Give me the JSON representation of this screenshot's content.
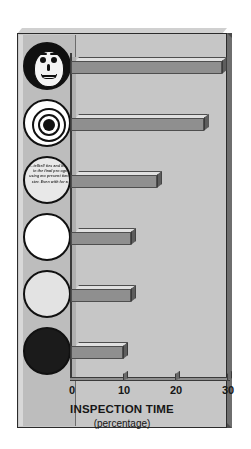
{
  "figure": {
    "title": "",
    "x_axis_label": "INSPECTION TIME",
    "x_axis_sublabel": "(percentage)",
    "tick_labels": [
      "0",
      "10",
      "20",
      "30"
    ]
  },
  "icons": [
    {
      "name": "face-icon",
      "label": "smiling face with dark hair"
    },
    {
      "name": "bullseye-icon",
      "label": "concentric circles target"
    },
    {
      "name": "text-circle-icon",
      "label": "circle filled with small italic text"
    },
    {
      "name": "white-circle-icon",
      "label": "plain white circle"
    },
    {
      "name": "gray-circle-icon",
      "label": "plain light gray circle"
    },
    {
      "name": "black-circle-icon",
      "label": "solid black circle"
    }
  ],
  "blurb_text": "...telltell ties and knowle up in the final pro ographer using mo present time, the g ster. Even with for a proje",
  "colors": {
    "page_background": "#ffffff",
    "frame_face": "#c8c8c8",
    "frame_shadow": "#4a4a4a",
    "plot_background": "#c6c6c6",
    "bar_front": "#8f8f8f",
    "bar_top": "#e0e0e0",
    "bar_cap": "#5d5d5d",
    "text": "#161616"
  },
  "chart_data": {
    "type": "bar",
    "orientation": "horizontal",
    "title": "",
    "xlabel": "INSPECTION TIME (percentage)",
    "ylabel": "",
    "xlim": [
      0,
      30
    ],
    "xticks": [
      0,
      10,
      20,
      30
    ],
    "grid": false,
    "legend": "none",
    "categories": [
      "face-icon",
      "bullseye-icon",
      "text-circle-icon",
      "white-circle-icon",
      "gray-circle-icon",
      "black-circle-icon"
    ],
    "values": [
      29,
      25.5,
      16.5,
      11.5,
      11.5,
      10
    ]
  }
}
